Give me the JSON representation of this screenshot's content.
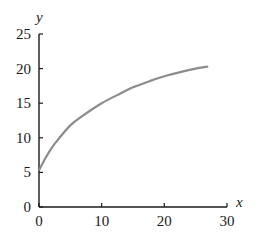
{
  "chart_data": {
    "type": "line",
    "title": "",
    "xlabel": "x",
    "ylabel": "y",
    "xlim": [
      0,
      30
    ],
    "ylim": [
      0,
      25
    ],
    "x_ticks": [
      0,
      10,
      20,
      30
    ],
    "y_ticks": [
      0,
      5,
      10,
      15,
      20,
      25
    ],
    "grid": false,
    "legend": null,
    "series": [
      {
        "name": "curve",
        "color": "#8c8c8c",
        "x": [
          0,
          1,
          2,
          3,
          5,
          7,
          10,
          13,
          15,
          18,
          20,
          23,
          25,
          27
        ],
        "y": [
          5.3,
          7.0,
          8.5,
          9.7,
          11.8,
          13.2,
          15.0,
          16.4,
          17.3,
          18.3,
          18.9,
          19.6,
          20.0,
          20.3
        ]
      }
    ]
  },
  "labels": {
    "x_axis": "x",
    "y_axis": "y",
    "x_ticks": [
      "0",
      "10",
      "20",
      "30"
    ],
    "y_ticks": [
      "0",
      "5",
      "10",
      "15",
      "20",
      "25"
    ]
  }
}
